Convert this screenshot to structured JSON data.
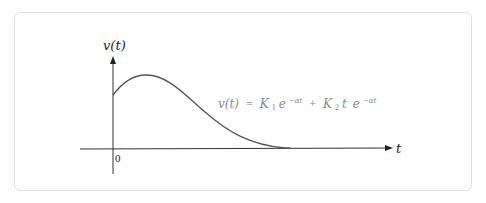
{
  "diagram": {
    "y_axis_label": "v(t)",
    "x_axis_label": "t",
    "origin_label": "0",
    "equation": {
      "lhs": "v(t)",
      "equals": "=",
      "term1_coeff": "K",
      "term1_sub": "1",
      "term1_base": "e",
      "term1_exp": "−αt",
      "plus": "+",
      "term2_coeff": "K",
      "term2_sub": "2",
      "term2_var": "t",
      "term2_base": "e",
      "term2_exp": "−αt"
    },
    "colors": {
      "curve": "#555555",
      "axes": "#333333",
      "equation_text": "#8a8a8a",
      "card_border": "#e2e2e2"
    }
  }
}
